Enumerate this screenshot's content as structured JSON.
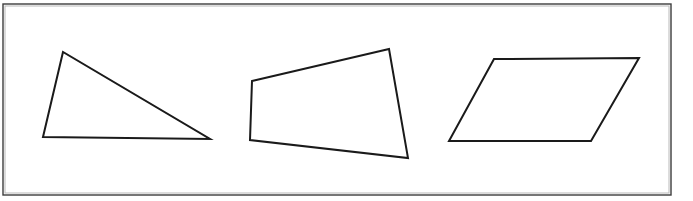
{
  "figure": {
    "background_color": "#ffffff",
    "width": 693,
    "height": 201,
    "frame": {
      "label": "outer-rectangle-frame",
      "stroke_color": "#3d3d3d",
      "x": 3,
      "y": 4,
      "width": 668,
      "height": 191
    },
    "stroke_color": "#1a1a1a",
    "fill_color": "#ffffff",
    "shapes": [
      {
        "name": "triangle",
        "label": "Triangle",
        "sides": 3,
        "points": "63,52 43,137 210,139",
        "vertices": [
          {
            "x": 63,
            "y": 52
          },
          {
            "x": 43,
            "y": 137
          },
          {
            "x": 210,
            "y": 139
          }
        ]
      },
      {
        "name": "quadrilateral",
        "label": "Irregular quadrilateral",
        "sides": 4,
        "points": "252,81 389,49 408,158 250,140",
        "vertices": [
          {
            "x": 252,
            "y": 81
          },
          {
            "x": 389,
            "y": 49
          },
          {
            "x": 408,
            "y": 158
          },
          {
            "x": 250,
            "y": 140
          }
        ]
      },
      {
        "name": "parallelogram",
        "label": "Parallelogram",
        "sides": 4,
        "points": "494,59 639,58 591,141 449,141",
        "vertices": [
          {
            "x": 494,
            "y": 59
          },
          {
            "x": 639,
            "y": 58
          },
          {
            "x": 591,
            "y": 141
          },
          {
            "x": 449,
            "y": 141
          }
        ]
      }
    ]
  }
}
